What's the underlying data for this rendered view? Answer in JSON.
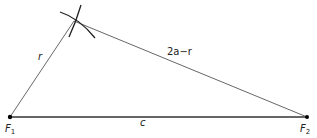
{
  "diagram": {
    "points": {
      "F1": {
        "label": "F",
        "subscript": "1",
        "x": 10,
        "y": 117
      },
      "F2": {
        "label": "F",
        "subscript": "2",
        "x": 307,
        "y": 117
      },
      "P": {
        "x": 74,
        "y": 21
      }
    },
    "edges": [
      {
        "from": "F1",
        "to": "P",
        "label": "r"
      },
      {
        "from": "P",
        "to": "F2",
        "label": "2a−r"
      },
      {
        "from": "F1",
        "to": "F2",
        "label": "c"
      }
    ],
    "labels": {
      "r": "r",
      "two_a_minus_r": "2a−r",
      "c": "c",
      "f1": "F",
      "f1_sub": "1",
      "f2": "F",
      "f2_sub": "2"
    },
    "colors": {
      "stroke": "#333333",
      "point": "#000000"
    }
  }
}
